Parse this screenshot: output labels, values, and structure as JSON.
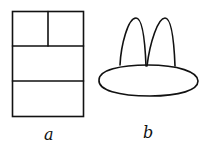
{
  "figures": [
    {
      "id": "a",
      "label": "a",
      "shape": "rectangle divided into four cells: two small cells on top row, two wide cells below",
      "rect": {
        "x": 12,
        "y": 11,
        "w": 71,
        "h": 105
      },
      "top_split_x": 48,
      "row_lines_y": [
        46,
        81
      ]
    },
    {
      "id": "b",
      "label": "b",
      "shape": "flat ellipse base with two pointed arches rising from it",
      "ellipse": {
        "cx": 148,
        "cy": 81,
        "rx": 50,
        "ry": 15
      },
      "arches": [
        {
          "x1": 120,
          "x2": 146,
          "peak_x": 136,
          "peak_y": 18,
          "base_y": 65
        },
        {
          "x1": 146,
          "x2": 175,
          "peak_x": 165,
          "peak_y": 18,
          "base_y": 66
        }
      ]
    }
  ],
  "colors": {
    "stroke": "#111111",
    "background": "#ffffff"
  }
}
